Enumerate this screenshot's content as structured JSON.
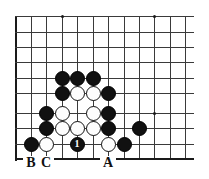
{
  "diagram": {
    "type": "go-board-corner",
    "board": {
      "left": 16,
      "top": 16,
      "right": 193,
      "bottom": 159,
      "spacing": 15.3,
      "columns_x": [
        16,
        31,
        46,
        62,
        77,
        93,
        108,
        124,
        139,
        154,
        170,
        185
      ],
      "rows_y": [
        16,
        32,
        47,
        62,
        78,
        93,
        113,
        128,
        144,
        159
      ],
      "edges": [
        "left",
        "bottom"
      ],
      "grid_color": "#3a3a3a",
      "edge_color": "#1a1a1a",
      "background": "#ffffff"
    },
    "star_points": [
      {
        "x": 62,
        "y": 16
      },
      {
        "x": 154,
        "y": 16
      },
      {
        "x": 154,
        "y": 113
      }
    ],
    "stones": [
      {
        "color": "black",
        "x": 62,
        "y": 78
      },
      {
        "color": "black",
        "x": 77,
        "y": 78
      },
      {
        "color": "black",
        "x": 93,
        "y": 78
      },
      {
        "color": "black",
        "x": 62,
        "y": 93
      },
      {
        "color": "white",
        "x": 77,
        "y": 93
      },
      {
        "color": "white",
        "x": 93,
        "y": 93
      },
      {
        "color": "black",
        "x": 108,
        "y": 93
      },
      {
        "color": "black",
        "x": 46,
        "y": 113
      },
      {
        "color": "white",
        "x": 62,
        "y": 113
      },
      {
        "color": "white",
        "x": 93,
        "y": 113
      },
      {
        "color": "black",
        "x": 108,
        "y": 113
      },
      {
        "color": "black",
        "x": 46,
        "y": 128
      },
      {
        "color": "white",
        "x": 62,
        "y": 128
      },
      {
        "color": "white",
        "x": 77,
        "y": 128
      },
      {
        "color": "white",
        "x": 93,
        "y": 128
      },
      {
        "color": "black",
        "x": 108,
        "y": 128
      },
      {
        "color": "black",
        "x": 139,
        "y": 128
      },
      {
        "color": "black",
        "x": 31,
        "y": 144
      },
      {
        "color": "white",
        "x": 46,
        "y": 144
      },
      {
        "color": "black",
        "x": 77,
        "y": 144,
        "number": "1"
      },
      {
        "color": "white",
        "x": 108,
        "y": 144
      },
      {
        "color": "black",
        "x": 124,
        "y": 144
      }
    ],
    "move_number": "1",
    "point_labels": [
      {
        "text": "B",
        "x": 31,
        "y": 163
      },
      {
        "text": "C",
        "x": 46,
        "y": 163
      },
      {
        "text": "A",
        "x": 108,
        "y": 163
      }
    ]
  }
}
